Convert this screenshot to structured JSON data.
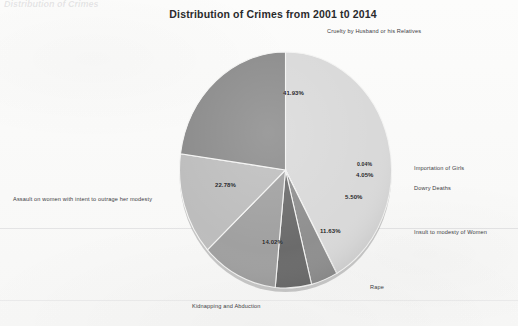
{
  "document": {
    "header_fragment": "Distribution of Crimes"
  },
  "chart_data": {
    "type": "pie",
    "title": "Distribution of Crimes from 2001 t0 2014",
    "subtitle": "",
    "xlabel": "",
    "ylabel": "",
    "units": "percent",
    "legend_position": "outside-callout",
    "grid": false,
    "categories": [
      "Cruelty by Husband or his Relatives",
      "Importation of Girls",
      "Dowry Deaths",
      "Insult to modesty of Women",
      "Rape",
      "Kidnapping and Abduction",
      "Assault on women with intent to outrage her modesty"
    ],
    "values": [
      41.93,
      0.04,
      4.05,
      5.5,
      11.63,
      14.02,
      22.78
    ],
    "value_labels": [
      "41.93%",
      "0.04%",
      "4.05%",
      "5.50%",
      "11.63%",
      "14.02%",
      "22.78%"
    ],
    "colors": [
      "#d9d9d9",
      "#6f6f6f",
      "#8f8f8f",
      "#6b6b6b",
      "#a0a0a0",
      "#bdbdbd",
      "#8a8a8a"
    ],
    "slices": [
      {
        "label": "Cruelty by Husband or his Relatives",
        "value": 41.93,
        "value_label": "41.93%",
        "color": "#d9d9d9"
      },
      {
        "label": "Importation of Girls",
        "value": 0.04,
        "value_label": "0.04%",
        "color": "#6f6f6f"
      },
      {
        "label": "Dowry Deaths",
        "value": 4.05,
        "value_label": "4.05%",
        "color": "#8f8f8f"
      },
      {
        "label": "Insult to modesty of Women",
        "value": 5.5,
        "value_label": "5.50%",
        "color": "#6b6b6b"
      },
      {
        "label": "Rape",
        "value": 11.63,
        "value_label": "11.63%",
        "color": "#a0a0a0"
      },
      {
        "label": "Kidnapping and Abduction",
        "value": 14.02,
        "value_label": "14.02%",
        "color": "#bdbdbd"
      },
      {
        "label": "Assault on women with intent to outrage her modesty",
        "value": 22.78,
        "value_label": "22.78%",
        "color": "#8a8a8a"
      }
    ]
  }
}
